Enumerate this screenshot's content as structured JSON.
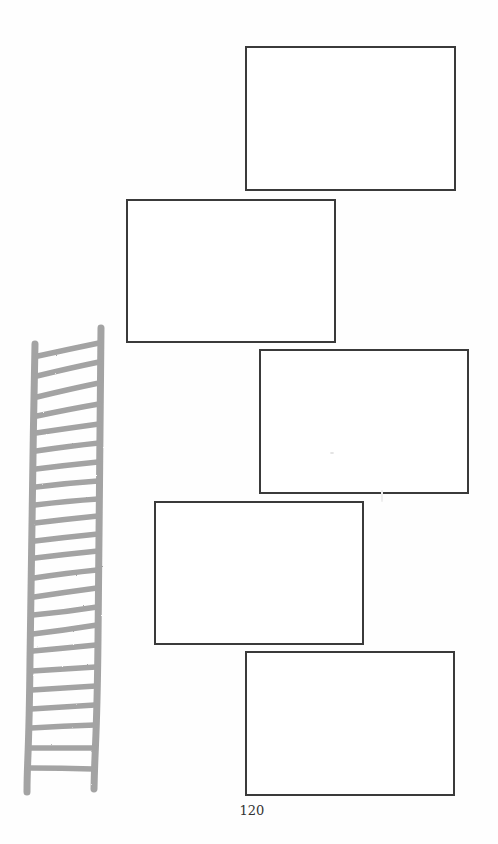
{
  "page": {
    "page_number": "120",
    "background": "#ffffff"
  },
  "frames": [
    {
      "id": "frame-1",
      "x": 245,
      "y": 46,
      "width": 211,
      "height": 145
    },
    {
      "id": "frame-2",
      "x": 126,
      "y": 199,
      "width": 210,
      "height": 144
    },
    {
      "id": "frame-3",
      "x": 259,
      "y": 349,
      "width": 210,
      "height": 145
    },
    {
      "id": "frame-4",
      "x": 154,
      "y": 501,
      "width": 210,
      "height": 144
    },
    {
      "id": "frame-5",
      "x": 245,
      "y": 651,
      "width": 210,
      "height": 145
    }
  ],
  "illustration": {
    "name": "ladder-drawing",
    "color": "#9c9c9c",
    "rung_count": 24
  },
  "colors": {
    "frame_border": "#3a3a3a",
    "ladder": "#9c9c9c",
    "text": "#333333"
  }
}
